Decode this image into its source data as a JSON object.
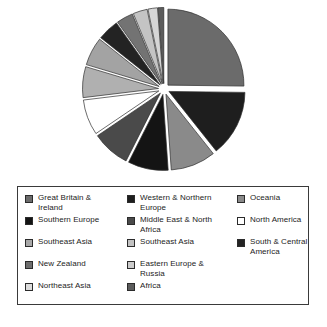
{
  "chart_data": {
    "type": "pie",
    "title": "",
    "subtitle": "",
    "xlabel": "",
    "ylabel": "",
    "legend_position": "bottom",
    "grid": false,
    "exploded": true,
    "categories": [
      "Great Britain & Ireland",
      "Western & Northern Europe",
      "Oceania",
      "Southern Europe",
      "Middle East & North Africa",
      "North America",
      "Southeast Asia",
      "Southeast Asia",
      "South & Central America",
      "New Zealand",
      "Eastern Europe & Russia",
      "Northeast Asia",
      "Africa"
    ],
    "values": [
      25.0,
      14.0,
      9.5,
      8.5,
      8.0,
      7.5,
      6.5,
      6.0,
      4.5,
      3.5,
      3.0,
      2.0,
      1.2
    ],
    "colors": [
      "#6b6b6b",
      "#1e1e1e",
      "#8a8a8a",
      "#141414",
      "#4a4a4a",
      "#ffffff",
      "#b0b0b0",
      "#a3a3a3",
      "#232323",
      "#737373",
      "#c4c4c4",
      "#d6d6d6",
      "#5c5c5c"
    ]
  },
  "legend": {
    "columns": [
      {
        "items": [
          {
            "label": "Great Britain &\nIreland",
            "color": "#6b6b6b"
          },
          {
            "label": "Southern Europe",
            "color": "#141414"
          },
          {
            "label": "Southeast Asia",
            "color": "#a8a8a8"
          },
          {
            "label": "New Zealand",
            "color": "#6e6e6e"
          },
          {
            "label": "Northeast Asia",
            "color": "#dcdcdc"
          }
        ]
      },
      {
        "items": [
          {
            "label": "Western & Northern\nEurope",
            "color": "#1e1e1e"
          },
          {
            "label": "Middle East & North\nAfrica",
            "color": "#4a4a4a"
          },
          {
            "label": "Southeast Asia",
            "color": "#c2c2c2"
          },
          {
            "label": "Eastern Europe &\nRussia",
            "color": "#cbcbcb"
          },
          {
            "label": "Africa",
            "color": "#5c5c5c"
          }
        ]
      },
      {
        "items": [
          {
            "label": "Oceania",
            "color": "#8a8a8a"
          },
          {
            "label": "North America",
            "color": "#ffffff"
          },
          {
            "label": "South & Central\nAmerica",
            "color": "#232323"
          }
        ]
      }
    ]
  },
  "caption": {
    "text": ""
  }
}
